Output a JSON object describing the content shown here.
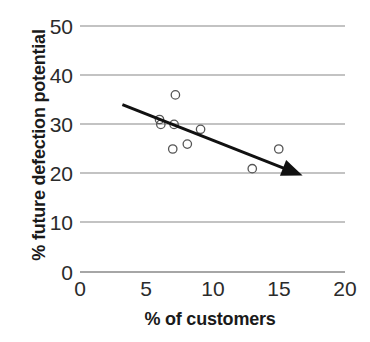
{
  "chart_data": {
    "type": "scatter",
    "title": "",
    "subtitle": "",
    "xlabel": "% of customers",
    "ylabel": "% future defection potential",
    "xlim": [
      0,
      20
    ],
    "ylim": [
      0,
      50
    ],
    "xticks": [
      0,
      5,
      10,
      15,
      20
    ],
    "yticks": [
      0,
      10,
      20,
      30,
      40,
      50
    ],
    "xtick_labels": [
      "0",
      "5",
      "10",
      "15",
      "20"
    ],
    "ytick_labels": [
      "0",
      "10",
      "20",
      "30",
      "40",
      "50"
    ],
    "grid": "horizontal",
    "legend": "none",
    "series": [
      {
        "name": "customers",
        "marker": "open-circle",
        "points": [
          {
            "x": 6.0,
            "y": 31
          },
          {
            "x": 6.1,
            "y": 30
          },
          {
            "x": 7.1,
            "y": 30
          },
          {
            "x": 7.2,
            "y": 36
          },
          {
            "x": 7.0,
            "y": 25
          },
          {
            "x": 8.1,
            "y": 26
          },
          {
            "x": 9.1,
            "y": 29
          },
          {
            "x": 13.0,
            "y": 21
          },
          {
            "x": 15.0,
            "y": 25
          }
        ]
      }
    ],
    "annotations": [
      {
        "type": "arrow",
        "name": "downward-trend-arrow",
        "from": {
          "x": 3.2,
          "y": 34
        },
        "to": {
          "x": 16.8,
          "y": 19.6
        },
        "description": "downward trend arrow"
      }
    ],
    "colors": {
      "marker_stroke": "#555555",
      "gridline": "#888888",
      "arrow": "#111111",
      "text": "#1a1a1a",
      "background": "#ffffff"
    }
  }
}
